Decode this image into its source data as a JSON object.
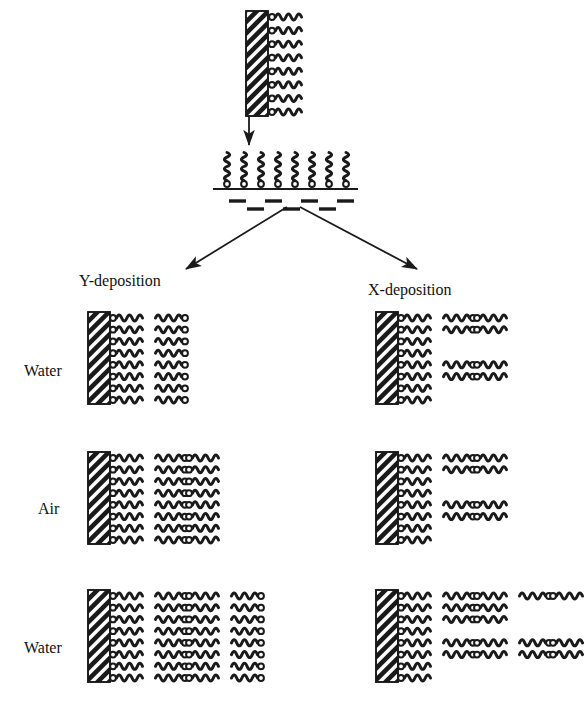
{
  "figure": {
    "title": "Langmuir-Blodgett film deposition: Y-deposition versus X-deposition",
    "ink_color": "#1a1a1a",
    "background_color": "#ffffff"
  },
  "top_stage": {
    "name": "coated-substrate-withdrawn",
    "substrate": {
      "x": 246,
      "y": 11,
      "width": 22,
      "height": 105,
      "hatch": "diagonal"
    },
    "molecule_rows": 8,
    "molecules_per_row": 1,
    "arrow": {
      "x": 249,
      "y_start": 116,
      "y_end": 145,
      "direction": "down"
    }
  },
  "trough_stage": {
    "name": "langmuir-monolayer-on-water",
    "surface_line": {
      "x1": 213,
      "x2": 358,
      "y": 189
    },
    "standing_molecules": 8,
    "water_dashes_upper": 4,
    "water_dashes_lower": 3
  },
  "branch_arrows": [
    {
      "name": "arrow-to-y-deposition",
      "x1": 287,
      "y1": 207,
      "x2": 186,
      "y2": 269
    },
    {
      "name": "arrow-to-x-deposition",
      "x1": 300,
      "y1": 207,
      "x2": 417,
      "y2": 269
    }
  ],
  "branches": [
    {
      "id": "y",
      "label": "Y-deposition",
      "label_x": 79,
      "label_y": 272
    },
    {
      "id": "x",
      "label": "X-deposition",
      "label_x": 368,
      "label_y": 281
    }
  ],
  "row_labels": [
    {
      "label": "Water",
      "x": 24,
      "y": 362
    },
    {
      "label": "Air",
      "x": 38,
      "y": 500
    },
    {
      "label": "Water",
      "x": 24,
      "y": 639
    }
  ],
  "rows": [
    {
      "name": "row-water-1",
      "top": 312,
      "substrate": {
        "x": 88,
        "y": 312,
        "width": 22,
        "height": 92
      },
      "y_units_per_line": [
        2,
        2,
        2,
        2,
        2,
        2,
        2,
        2
      ],
      "x_substrate": {
        "x": 376,
        "y": 312,
        "width": 22,
        "height": 92
      },
      "x_units_per_line": [
        3,
        3,
        1,
        1,
        3,
        3,
        1,
        1
      ]
    },
    {
      "name": "row-air",
      "top": 452,
      "substrate": {
        "x": 88,
        "y": 452,
        "width": 22,
        "height": 92
      },
      "y_units_per_line": [
        3,
        3,
        3,
        3,
        3,
        3,
        3,
        3
      ],
      "x_substrate": {
        "x": 376,
        "y": 452,
        "width": 22,
        "height": 92
      },
      "x_units_per_line": [
        3,
        3,
        1,
        1,
        3,
        3,
        1,
        1
      ]
    },
    {
      "name": "row-water-2",
      "top": 590,
      "substrate": {
        "x": 88,
        "y": 590,
        "width": 22,
        "height": 92
      },
      "y_units_per_line": [
        4,
        4,
        4,
        4,
        4,
        4,
        4,
        4
      ],
      "x_substrate": {
        "x": 376,
        "y": 590,
        "width": 22,
        "height": 92
      },
      "x_units_per_line": [
        5,
        3,
        3,
        1,
        5,
        5,
        1,
        1
      ]
    }
  ]
}
